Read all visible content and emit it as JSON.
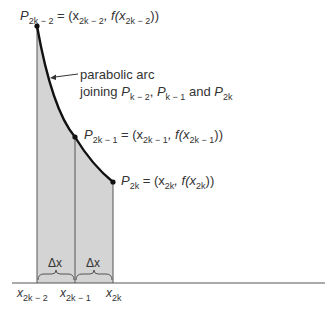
{
  "diagram": {
    "points": [
      {
        "id": "P_2k-2",
        "label": "P",
        "sub": "2k − 2",
        "eq": " = (x",
        "eq_sub": "2k − 2",
        "eq_mid": ", f(x",
        "eq_sub2": "2k − 2",
        "eq_end": "))"
      },
      {
        "id": "P_2k-1",
        "label": "P",
        "sub": "2k − 1",
        "eq": " = (x",
        "eq_sub": "2k − 1",
        "eq_mid": ", f(x",
        "eq_sub2": "2k − 1",
        "eq_end": "))"
      },
      {
        "id": "P_2k",
        "label": "P",
        "sub": "2k",
        "eq": " = (x",
        "eq_sub": "2k",
        "eq_mid": ", f(x",
        "eq_sub2": "2k",
        "eq_end": "))"
      }
    ],
    "annotation": {
      "line1": "parabolic arc",
      "line2_prefix": "joining ",
      "p1": "P",
      "p1_sub": "k − 2",
      "sep": ", ",
      "p2": "P",
      "p2_sub": "k − 1",
      "and": " and ",
      "p3": "P",
      "p3_sub": "2k"
    },
    "delta_labels": [
      "Δx",
      "Δx"
    ],
    "x_ticks": [
      {
        "label": "x",
        "sub": "2k − 2"
      },
      {
        "label": "x",
        "sub": "2k − 1"
      },
      {
        "label": "x",
        "sub": "2k"
      }
    ],
    "colors": {
      "shade": "#d4d4d4",
      "curve": "#111111",
      "axis": "#555555"
    }
  }
}
